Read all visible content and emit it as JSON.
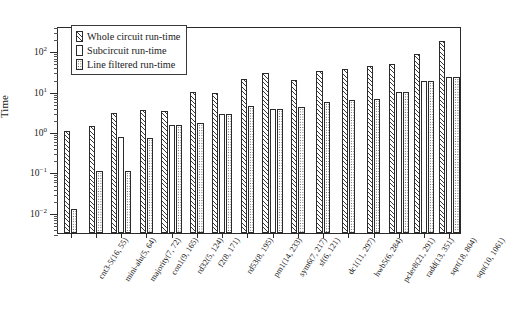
{
  "chart_data": {
    "type": "bar",
    "title": "",
    "xlabel": "",
    "ylabel": "Time",
    "yscale": "log",
    "ylim": [
      0.003,
      400
    ],
    "ytick_labels": [
      "10²",
      "10¹",
      "10⁰",
      "10⁻¹",
      "10⁻²"
    ],
    "ytick_values": [
      100,
      10,
      1,
      0.1,
      0.01
    ],
    "grid": false,
    "legend_position": "upper-left-inside",
    "categories": [
      "cnt3-5(16, 55)",
      "mini-alu(5, 64)",
      "majority(7, 72)",
      "con1(9, 165)",
      "rd32(5, 124)",
      "f2(8, 171)",
      "rd53(8, 195)",
      "pm1(14, 233)",
      "sym6(7, 217)",
      "sf(6, 121)",
      "dc1(11, 297)",
      "hwb5(6, 284)",
      "pcler8(21, 291)",
      "radd(13, 351)",
      "sqrt(18, 804)",
      "sqn(10, 1061)"
    ],
    "series": [
      {
        "name": "Whole circuit run-time",
        "pattern": "diagonal-hatch",
        "values": [
          1.0,
          1.35,
          2.8,
          3.3,
          3.1,
          9.2,
          8.6,
          20.0,
          28.0,
          18.0,
          30.0,
          35.0,
          40.0,
          45.0,
          80.0,
          170.0
        ]
      },
      {
        "name": "Subcircuit run-time",
        "pattern": "plain",
        "values": [
          null,
          null,
          0.72,
          null,
          1.45,
          null,
          2.6,
          null,
          3.6,
          null,
          null,
          null,
          null,
          9.5,
          17.0,
          22.0
        ]
      },
      {
        "name": "Line filtered run-time",
        "pattern": "dotted",
        "values": [
          0.012,
          0.105,
          0.105,
          0.67,
          1.45,
          1.55,
          2.6,
          4.2,
          3.6,
          3.9,
          5.2,
          6.0,
          6.2,
          9.5,
          17.0,
          22.0
        ]
      }
    ]
  },
  "legend": {
    "items": [
      {
        "label": "Whole circuit run-time",
        "pattern": "diagonal-hatch"
      },
      {
        "label": "Subcircuit run-time",
        "pattern": "plain"
      },
      {
        "label": "Line filtered run-time",
        "pattern": "dotted"
      }
    ]
  },
  "axes": {
    "y_title": "Time"
  }
}
